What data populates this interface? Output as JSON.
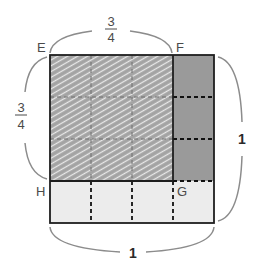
{
  "diagram": {
    "points": {
      "E": "E",
      "F": "F",
      "G": "G",
      "H": "H"
    },
    "labels": {
      "top_numerator": "3",
      "top_denominator": "4",
      "left_numerator": "3",
      "left_denominator": "4",
      "right_value": "1",
      "bottom_value": "1"
    },
    "grid": {
      "rows": 4,
      "cols": 4
    },
    "regions": [
      {
        "name": "EFGH",
        "rows": 3,
        "cols": 3,
        "fill": "hatched",
        "description": "3/4 × 3/4 product region"
      },
      {
        "name": "right-column",
        "rows": 3,
        "cols": 1,
        "fill": "dark-gray"
      },
      {
        "name": "bottom-row",
        "rows": 1,
        "cols": 4,
        "fill": "light-gray"
      }
    ],
    "colors": {
      "hatch_base": "#a3a3a3",
      "hatch_line": "#e6e6e6",
      "dark_gray": "#9a9a9a",
      "light_gray": "#ececec",
      "outline": "#222222",
      "brace": "#8c8c8c"
    }
  }
}
